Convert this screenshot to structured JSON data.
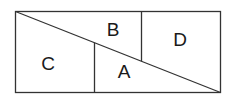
{
  "diagram": {
    "type": "rectangle-partition",
    "stroke_color": "#333333",
    "background": "#ffffff",
    "regions": [
      {
        "label": "A",
        "x": 124,
        "y": 78
      },
      {
        "label": "B",
        "x": 113,
        "y": 36
      },
      {
        "label": "C",
        "x": 48,
        "y": 70
      },
      {
        "label": "D",
        "x": 180,
        "y": 46
      }
    ]
  }
}
